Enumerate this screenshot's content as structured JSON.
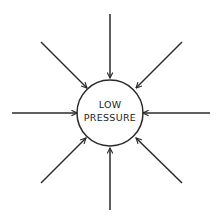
{
  "diagram": {
    "center_label_line1": "LOW",
    "center_label_line2": "PRESSURE",
    "arrow_count": 8,
    "arrow_direction": "inward",
    "stroke_color": "#2a2a2a",
    "background_color": "#ffffff"
  }
}
